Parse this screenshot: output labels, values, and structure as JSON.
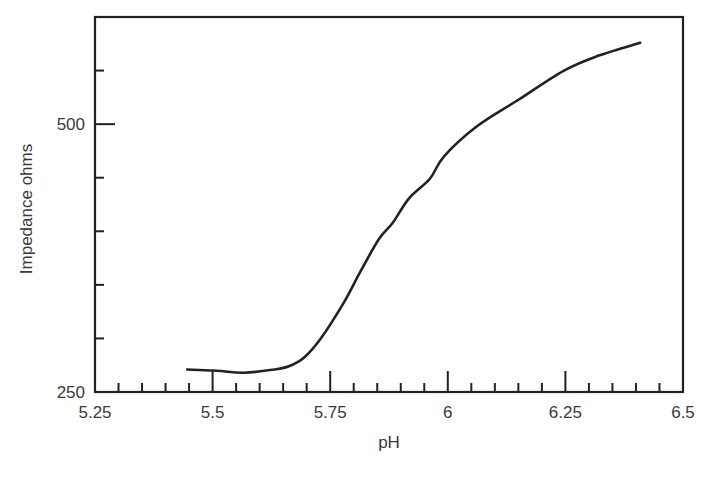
{
  "chart_data": {
    "type": "line",
    "title": "",
    "xlabel": "pH",
    "ylabel": "Impedance ohms",
    "xlim": [
      5.25,
      6.5
    ],
    "ylim": [
      250,
      600
    ],
    "x_ticks_major": [
      5.25,
      5.5,
      5.75,
      6,
      6.25,
      6.5
    ],
    "x_tick_labels": [
      "5.25",
      "5.5",
      "5.75",
      "6",
      "6.25",
      "6.5"
    ],
    "x_minor_step": 0.05,
    "y_ticks": [
      250,
      300,
      350,
      400,
      450,
      500,
      550
    ],
    "y_tick_labels": [
      {
        "value": 250,
        "label": "250"
      },
      {
        "value": 500,
        "label": "500"
      }
    ],
    "grid": false,
    "legend": null,
    "series": [
      {
        "name": "Impedance",
        "x": [
          5.446,
          5.503,
          5.567,
          5.631,
          5.662,
          5.694,
          5.73,
          5.777,
          5.815,
          5.854,
          5.883,
          5.918,
          5.962,
          5.992,
          6.062,
          6.151,
          6.247,
          6.321,
          6.409
        ],
        "y": [
          271,
          270,
          268,
          271,
          274,
          282,
          300,
          332,
          363,
          393,
          408,
          431,
          449,
          470,
          498,
          523,
          550,
          564,
          576
        ]
      }
    ]
  },
  "caption_fragment": ""
}
